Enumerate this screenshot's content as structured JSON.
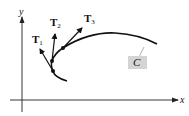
{
  "figure": {
    "axes": {
      "x_label": "x",
      "y_label": "y"
    },
    "curve_label": "C",
    "tangent_vectors": [
      {
        "label": "T",
        "subscript": "1"
      },
      {
        "label": "T",
        "subscript": "2"
      },
      {
        "label": "T",
        "subscript": "3"
      }
    ],
    "colors": {
      "ink": "#111111",
      "label_box": "#d4d4d4",
      "background": "#ffffff"
    }
  }
}
